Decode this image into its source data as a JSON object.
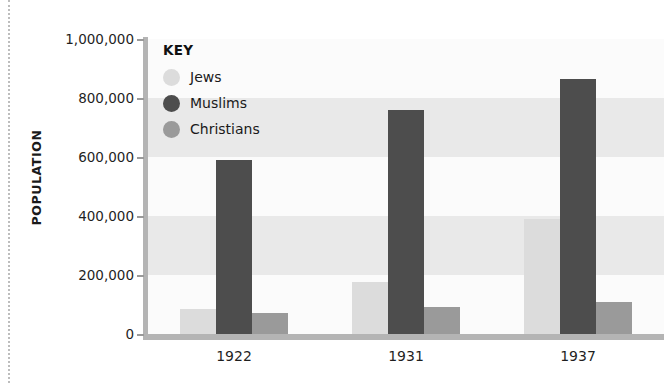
{
  "axis": {
    "y_title": "POPULATION",
    "y_ticks": [
      "1,000,000",
      "800,000",
      "600,000",
      "400,000",
      "200,000",
      "0"
    ],
    "x_ticks": [
      "1922",
      "1931",
      "1937"
    ]
  },
  "legend": {
    "title": "KEY",
    "items": [
      {
        "label": "Jews",
        "color": "#dcdcdc"
      },
      {
        "label": "Muslims",
        "color": "#4d4d4d"
      },
      {
        "label": "Christians",
        "color": "#9a9a9a"
      }
    ]
  },
  "colors": {
    "jews": "#dcdcdc",
    "muslims": "#4d4d4d",
    "christians": "#9a9a9a",
    "band_light": "#e9e9e9",
    "band_white": "#fbfbfb",
    "axis": "#b4b4b4",
    "text": "#1a1a1a"
  },
  "chart_data": {
    "type": "bar",
    "title": "",
    "subtitle": "",
    "xlabel": "",
    "ylabel": "POPULATION",
    "categories": [
      "1922",
      "1931",
      "1937"
    ],
    "ylim": [
      0,
      1000000
    ],
    "ytick_values": [
      0,
      200000,
      400000,
      600000,
      800000,
      1000000
    ],
    "grid": "horizontal-bands",
    "legend_position": "inside-top-left",
    "series": [
      {
        "name": "Jews",
        "color": "#dcdcdc",
        "values": [
          85000,
          175000,
          390000
        ]
      },
      {
        "name": "Muslims",
        "color": "#4d4d4d",
        "values": [
          590000,
          760000,
          865000
        ]
      },
      {
        "name": "Christians",
        "color": "#9a9a9a",
        "values": [
          70000,
          90000,
          110000
        ]
      }
    ]
  }
}
